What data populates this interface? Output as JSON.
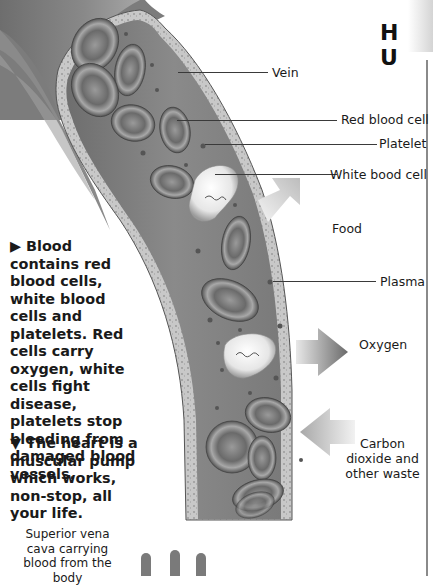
{
  "header": {
    "letters": "H U"
  },
  "illustration": {
    "subject": "Cross-section of a vein showing blood components",
    "labels": {
      "vein": "Vein",
      "red_blood_cell": "Red blood cell",
      "platelet": "Platelet",
      "white_blood_cell": "White bood cell",
      "food": "Food",
      "plasma": "Plasma",
      "oxygen": "Oxygen",
      "carbon_dioxide": "Carbon dioxide and other waste"
    }
  },
  "body_text": {
    "blood_paragraph": "▶ Blood contains red blood cells, white blood cells and platelets. Red cells carry oxygen, white cells fight disease, platelets stop bleeding from damaged blood vessels.",
    "heart_paragraph": "▼ The heart is a muscular pump which works, non-stop, all your life."
  },
  "heart_caption": {
    "superior_vena_cava": "Superior vena cava carrying blood from the body"
  }
}
